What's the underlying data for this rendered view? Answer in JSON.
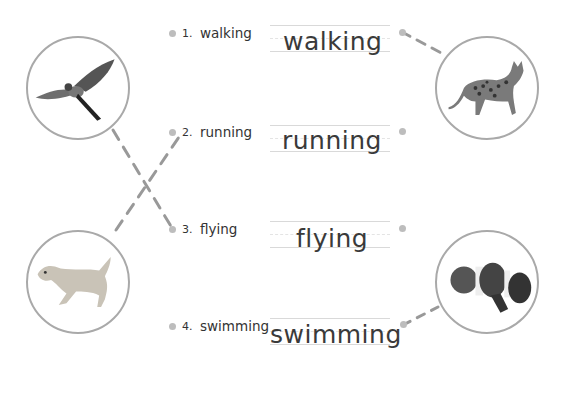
{
  "exercise": {
    "items": [
      {
        "number": "1.",
        "word": "walking",
        "answer": "walking"
      },
      {
        "number": "2.",
        "word": "running",
        "answer": "running"
      },
      {
        "number": "3.",
        "word": "flying",
        "answer": "flying"
      },
      {
        "number": "4.",
        "word": "swimming",
        "answer": "swimming"
      }
    ],
    "pictures": {
      "top_left": {
        "animal": "parrot",
        "icon": "parrot-icon"
      },
      "bottom_left": {
        "animal": "dog",
        "icon": "dog-icon"
      },
      "top_right": {
        "animal": "cat",
        "icon": "cat-icon"
      },
      "bottom_right": {
        "animal": "clownfish",
        "icon": "fish-icon"
      }
    },
    "connections": [
      {
        "from": "parrot",
        "to": "flying"
      },
      {
        "from": "dog",
        "to": "running"
      },
      {
        "from": "walking",
        "to": "cat"
      },
      {
        "from": "swimming",
        "to": "clownfish"
      }
    ],
    "colors": {
      "line": "#999999",
      "dot": "#bdbdbd",
      "circle": "#a9a9a9",
      "text": "#333333"
    }
  }
}
